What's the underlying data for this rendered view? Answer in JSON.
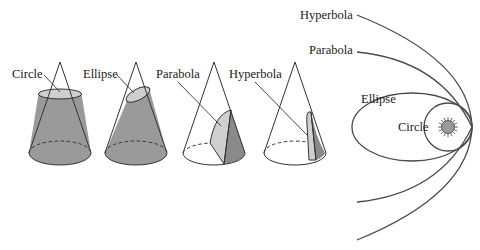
{
  "figure": {
    "cones": {
      "labels": {
        "circle": "Circle",
        "ellipse": "Ellipse",
        "parabola": "Parabola",
        "hyperbola": "Hyperbola"
      }
    },
    "orbits": {
      "labels": {
        "hyperbola": "Hyperbola",
        "parabola": "Parabola",
        "ellipse": "Ellipse",
        "circle": "Circle"
      },
      "center_body": "sun-icon"
    },
    "colors": {
      "cone_fill": "#9a9a9a",
      "cone_fill_dark": "#8a8a8a",
      "section_fill": "#cfcfcf",
      "line": "#333333",
      "background": "#ffffff"
    }
  }
}
